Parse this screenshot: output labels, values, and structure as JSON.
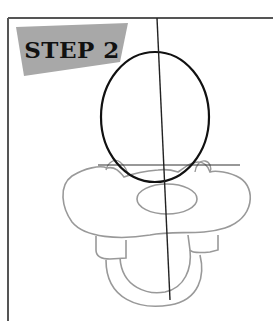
{
  "step": {
    "label": "STEP 2"
  },
  "colors": {
    "frame_border": "#555555",
    "label_bg": "#a8a8a8",
    "guide_line": "#222222",
    "head_outline": "#111111",
    "sketch_outline": "#999999"
  }
}
